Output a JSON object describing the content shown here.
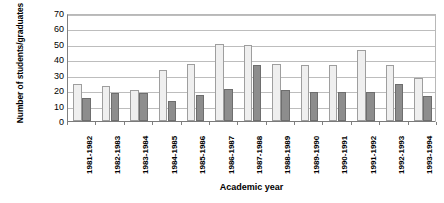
{
  "chart_data": {
    "type": "bar",
    "title": "",
    "xlabel": "Academic year",
    "ylabel": "Number of students/graduates",
    "ylim": [
      0,
      70
    ],
    "ytick_values": [
      0,
      10,
      20,
      30,
      40,
      50,
      60,
      70
    ],
    "ytick_labels": [
      "0",
      "10",
      "20",
      "30",
      "40",
      "50",
      "60",
      "70"
    ],
    "grid": true,
    "legend": false,
    "legend_position": "none",
    "categories": [
      "1981-1982",
      "1982-1983",
      "1983-1984",
      "1984-1985",
      "1985-1986",
      "1986-1987",
      "1987-1988",
      "1988-1989",
      "1989-1990",
      "1990-1991",
      "1991-1992",
      "1992-1993",
      "1993-1994"
    ],
    "series": [
      {
        "name": "students",
        "color": "#efefef",
        "border_color": "#9e9e9e",
        "values": [
          24,
          23,
          20,
          33,
          37,
          50,
          49,
          37,
          36,
          36,
          46,
          36,
          28
        ]
      },
      {
        "name": "graduates",
        "color": "#8d8d8d",
        "border_color": "#6e6e6e",
        "values": [
          15,
          18,
          18,
          13,
          17,
          21,
          36,
          20,
          19,
          19,
          19,
          24,
          16
        ]
      }
    ]
  },
  "axes": {
    "y_title": "Number of students/graduates",
    "x_title": "Academic year"
  }
}
